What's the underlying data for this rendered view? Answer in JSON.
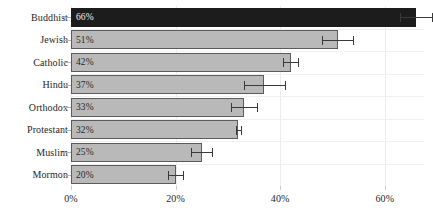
{
  "chart_data": {
    "type": "bar",
    "orientation": "horizontal",
    "title": "",
    "subtitle": "",
    "xlabel": "",
    "ylabel": "",
    "categories": [
      "Buddhist",
      "Jewish",
      "Catholic",
      "Hindu",
      "Orthodox",
      "Protestant",
      "Muslim",
      "Mormon"
    ],
    "values": [
      66,
      51,
      42,
      37,
      33,
      32,
      25,
      20
    ],
    "value_labels": [
      "66%",
      "51%",
      "42%",
      "37%",
      "33%",
      "32%",
      "25%",
      "20%"
    ],
    "errors": [
      3.0,
      3.0,
      1.5,
      4.0,
      2.5,
      0.5,
      2.0,
      1.5
    ],
    "highlight_index": 0,
    "xlim": [
      0,
      67.5
    ],
    "xticks": [
      0,
      20,
      40,
      60
    ],
    "xtick_labels": [
      "0%",
      "20%",
      "40%",
      "60%"
    ],
    "grid": {
      "vertical": true,
      "horizontal": true
    },
    "legend": null,
    "colors": {
      "bar_fill": "#b9b9b9",
      "bar_edge": "#5b5b5b",
      "highlight_fill": "#1c1c1c",
      "highlight_text": "#f2f2f2",
      "label_text": "#262626",
      "value_text": "#2a2a2a",
      "error_bar": "#3a3a3a",
      "gridline": "#ececec",
      "background": "#ffffff"
    }
  }
}
